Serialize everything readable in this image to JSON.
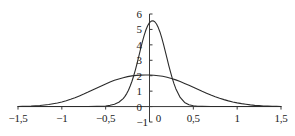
{
  "chart_data": {
    "type": "line",
    "title": "",
    "subtitle": "",
    "xlabel": "",
    "ylabel": "",
    "xlim": [
      -1.5,
      1.5
    ],
    "ylim": [
      -1,
      6
    ],
    "grid": false,
    "legend": "none",
    "decimal_separator": ",",
    "x_ticks": [
      -1.5,
      -1,
      -0.5,
      0,
      0.5,
      1,
      1.5
    ],
    "x_tick_labels": [
      "−1,5",
      "−1",
      "−0,5",
      "0",
      "0,5",
      "1",
      "1,5"
    ],
    "y_ticks": [
      -1,
      0,
      1,
      2,
      3,
      4,
      5,
      6
    ],
    "y_tick_labels": [
      "−1",
      "0",
      "1",
      "2",
      "3",
      "4",
      "5",
      "6"
    ],
    "axis_origin_label": "0",
    "series": [
      {
        "name": "narrow-peak-curve",
        "color": "#2b2b2b",
        "peak_x": -0.02,
        "peak_y": 5.6,
        "x": [
          -1.5,
          -1.4,
          -1.3,
          -1.2,
          -1.1,
          -1,
          -0.9,
          -0.8,
          -0.7,
          -0.6,
          -0.55,
          -0.5,
          -0.45,
          -0.4,
          -0.35,
          -0.3,
          -0.28,
          -0.26,
          -0.24,
          -0.22,
          -0.2,
          -0.18,
          -0.16,
          -0.14,
          -0.12,
          -0.1,
          -0.08,
          -0.06,
          -0.04,
          -0.02,
          0,
          0.02,
          0.04,
          0.06,
          0.08,
          0.1,
          0.12,
          0.14,
          0.16,
          0.18,
          0.2,
          0.22,
          0.24,
          0.26,
          0.28,
          0.3,
          0.35,
          0.4,
          0.45,
          0.5,
          0.55,
          0.6,
          0.7,
          0.8,
          0.9,
          1,
          1.1,
          1.2,
          1.3,
          1.4,
          1.5
        ],
        "y": [
          0.0,
          0.0,
          0.0,
          0.0,
          0.0,
          0.0,
          0.0,
          0.0,
          0.0,
          0.01,
          0.02,
          0.04,
          0.08,
          0.15,
          0.28,
          0.52,
          0.66,
          0.84,
          1.06,
          1.33,
          1.64,
          2.0,
          2.4,
          2.84,
          3.3,
          3.77,
          4.22,
          4.63,
          4.98,
          5.25,
          5.44,
          5.54,
          5.56,
          5.5,
          5.35,
          5.12,
          4.82,
          4.45,
          4.03,
          3.58,
          3.12,
          2.66,
          2.23,
          1.83,
          1.47,
          1.16,
          0.59,
          0.27,
          0.12,
          0.05,
          0.02,
          0.01,
          0.0,
          0.0,
          0.0,
          0.0,
          0.0,
          0.0,
          0.0,
          0.0,
          0.0
        ]
      },
      {
        "name": "wide-flat-curve",
        "color": "#2b2b2b",
        "peak_x": -0.05,
        "peak_y": 2.05,
        "x": [
          -1.5,
          -1.45,
          -1.4,
          -1.35,
          -1.3,
          -1.25,
          -1.2,
          -1.15,
          -1.1,
          -1.05,
          -1,
          -0.95,
          -0.9,
          -0.85,
          -0.8,
          -0.75,
          -0.7,
          -0.65,
          -0.6,
          -0.55,
          -0.5,
          -0.45,
          -0.4,
          -0.35,
          -0.3,
          -0.25,
          -0.2,
          -0.15,
          -0.1,
          -0.05,
          0,
          0.05,
          0.1,
          0.15,
          0.2,
          0.25,
          0.3,
          0.35,
          0.4,
          0.45,
          0.5,
          0.55,
          0.6,
          0.65,
          0.7,
          0.75,
          0.8,
          0.85,
          0.9,
          0.95,
          1,
          1.05,
          1.1,
          1.15,
          1.2,
          1.25,
          1.3,
          1.35,
          1.4,
          1.45,
          1.5
        ],
        "y": [
          0.0,
          0.01,
          0.02,
          0.03,
          0.05,
          0.07,
          0.1,
          0.13,
          0.18,
          0.23,
          0.3,
          0.38,
          0.47,
          0.57,
          0.69,
          0.81,
          0.94,
          1.08,
          1.21,
          1.34,
          1.47,
          1.59,
          1.7,
          1.79,
          1.87,
          1.94,
          1.99,
          2.02,
          2.04,
          2.05,
          2.05,
          2.03,
          2.0,
          1.96,
          1.9,
          1.82,
          1.73,
          1.62,
          1.5,
          1.38,
          1.25,
          1.12,
          0.99,
          0.87,
          0.75,
          0.64,
          0.54,
          0.45,
          0.37,
          0.3,
          0.24,
          0.19,
          0.15,
          0.11,
          0.08,
          0.06,
          0.04,
          0.03,
          0.02,
          0.01,
          0.0
        ]
      }
    ]
  },
  "axes": {
    "axis_color": "#3a3a3a",
    "tick_color": "#3a3a3a"
  }
}
